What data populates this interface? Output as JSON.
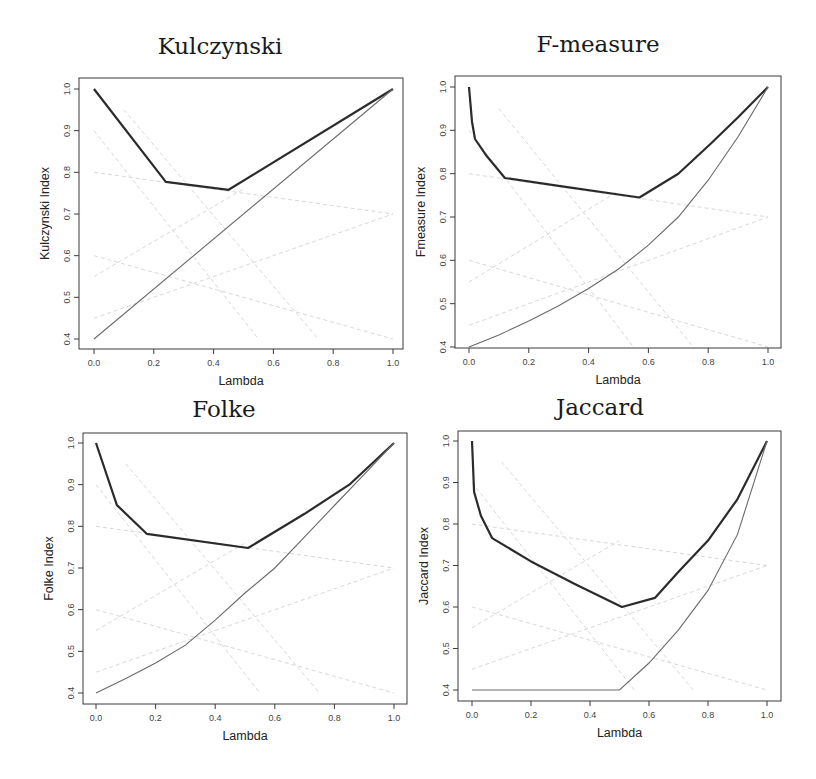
{
  "chart_data": [
    {
      "type": "line",
      "title": "Kulczynski",
      "xlabel": "Lambda",
      "ylabel": "Kulczynski Index",
      "xlim": [
        0,
        1
      ],
      "ylim": [
        0.4,
        1.0
      ],
      "xticks": [
        "0.0",
        "0.2",
        "0.4",
        "0.6",
        "0.8",
        "1.0"
      ],
      "yticks": [
        "0.4",
        "0.5",
        "0.6",
        "0.7",
        "0.8",
        "0.9",
        "1.0"
      ],
      "grid": false,
      "series": [
        {
          "name": "index",
          "style": "thick",
          "x": [
            0.0,
            0.24,
            0.45,
            1.0
          ],
          "y": [
            1.0,
            0.777,
            0.758,
            1.0
          ]
        },
        {
          "name": "baseline",
          "style": "thin",
          "x": [
            0.0,
            1.0
          ],
          "y": [
            0.4,
            1.0
          ]
        }
      ],
      "frame": {
        "left": 79,
        "top": 78,
        "right": 403,
        "bottom": 349,
        "x0": 94,
        "x1": 393,
        "ytop": 89,
        "ybot": 339,
        "title_x": 220,
        "title_y": 54
      }
    },
    {
      "type": "line",
      "title": "F-measure",
      "xlabel": "Lambda",
      "ylabel": "Fmeasure Index",
      "xlim": [
        0,
        1
      ],
      "ylim": [
        0.4,
        1.0
      ],
      "xticks": [
        "0.0",
        "0.2",
        "0.4",
        "0.6",
        "0.8",
        "1.0"
      ],
      "yticks": [
        "0.4",
        "0.5",
        "0.6",
        "0.7",
        "0.8",
        "0.9",
        "1.0"
      ],
      "grid": false,
      "series": [
        {
          "name": "index",
          "style": "thick",
          "x": [
            0.0,
            0.01,
            0.02,
            0.06,
            0.12,
            0.3,
            0.57,
            0.7,
            0.81,
            0.9,
            1.0
          ],
          "y": [
            1.0,
            0.92,
            0.88,
            0.84,
            0.79,
            0.772,
            0.745,
            0.8,
            0.87,
            0.93,
            1.0
          ]
        },
        {
          "name": "baseline",
          "style": "thin",
          "x": [
            0.0,
            0.1,
            0.2,
            0.3,
            0.4,
            0.5,
            0.6,
            0.7,
            0.8,
            0.9,
            1.0
          ],
          "y": [
            0.4,
            0.428,
            0.46,
            0.495,
            0.535,
            0.58,
            0.635,
            0.7,
            0.785,
            0.885,
            1.0
          ]
        }
      ],
      "frame": {
        "left": 455,
        "top": 76,
        "right": 781,
        "bottom": 348,
        "x0": 469,
        "x1": 768,
        "ytop": 87,
        "ybot": 347,
        "title_x": 598,
        "title_y": 52
      }
    },
    {
      "type": "line",
      "title": "Folke",
      "xlabel": "Lambda",
      "ylabel": "Folke Index",
      "xlim": [
        0,
        1
      ],
      "ylim": [
        0.4,
        1.0
      ],
      "xticks": [
        "0.0",
        "0.2",
        "0.4",
        "0.6",
        "0.8",
        "1.0"
      ],
      "yticks": [
        "0.4",
        "0.5",
        "0.6",
        "0.7",
        "0.8",
        "0.9",
        "1.0"
      ],
      "grid": false,
      "series": [
        {
          "name": "index",
          "style": "thick",
          "x": [
            0.0,
            0.07,
            0.17,
            0.51,
            0.7,
            0.85,
            1.0
          ],
          "y": [
            1.0,
            0.851,
            0.782,
            0.748,
            0.83,
            0.9,
            1.0
          ]
        },
        {
          "name": "baseline",
          "style": "thin",
          "x": [
            0.0,
            0.1,
            0.2,
            0.3,
            0.4,
            0.5,
            0.6,
            0.7,
            0.8,
            0.9,
            1.0
          ],
          "y": [
            0.4,
            0.435,
            0.472,
            0.515,
            0.575,
            0.64,
            0.7,
            0.775,
            0.85,
            0.925,
            1.0
          ]
        }
      ],
      "frame": {
        "left": 83,
        "top": 433,
        "right": 407,
        "bottom": 704,
        "x0": 96,
        "x1": 394,
        "ytop": 443,
        "ybot": 693,
        "title_x": 224,
        "title_y": 417
      }
    },
    {
      "type": "line",
      "title": "Jaccard",
      "xlabel": "Lambda",
      "ylabel": "Jaccard Index",
      "xlim": [
        0,
        1
      ],
      "ylim": [
        0.4,
        1.0
      ],
      "xticks": [
        "0.0",
        "0.2",
        "0.4",
        "0.6",
        "0.8",
        "1.0"
      ],
      "yticks": [
        "0.4",
        "0.5",
        "0.6",
        "0.7",
        "0.8",
        "0.9",
        "1.0"
      ],
      "grid": false,
      "series": [
        {
          "name": "index",
          "style": "thick",
          "x": [
            0.0,
            0.007,
            0.03,
            0.068,
            0.2,
            0.35,
            0.508,
            0.62,
            0.7,
            0.8,
            0.9,
            1.0
          ],
          "y": [
            1.0,
            0.877,
            0.82,
            0.766,
            0.71,
            0.655,
            0.6,
            0.622,
            0.685,
            0.76,
            0.86,
            1.0
          ]
        },
        {
          "name": "baseline",
          "style": "thin",
          "x": [
            0.0,
            0.5,
            0.6,
            0.7,
            0.8,
            0.9,
            1.0
          ],
          "y": [
            0.4,
            0.4,
            0.465,
            0.545,
            0.64,
            0.775,
            1.0
          ]
        }
      ],
      "frame": {
        "left": 458,
        "top": 431,
        "right": 781,
        "bottom": 701,
        "x0": 472,
        "x1": 767,
        "ytop": 441,
        "ybot": 690,
        "title_x": 600,
        "title_y": 415
      }
    }
  ],
  "ghost_lines": [
    [
      [
        0.0,
        0.9
      ],
      [
        0.55,
        0.4
      ]
    ],
    [
      [
        0.0,
        0.8
      ],
      [
        1.0,
        0.7
      ]
    ],
    [
      [
        0.0,
        0.55
      ],
      [
        0.5,
        0.76
      ]
    ],
    [
      [
        0.0,
        0.45
      ],
      [
        1.0,
        0.7
      ]
    ],
    [
      [
        0.0,
        0.6
      ],
      [
        1.0,
        0.4
      ]
    ],
    [
      [
        0.1,
        0.95
      ],
      [
        0.75,
        0.4
      ]
    ]
  ]
}
